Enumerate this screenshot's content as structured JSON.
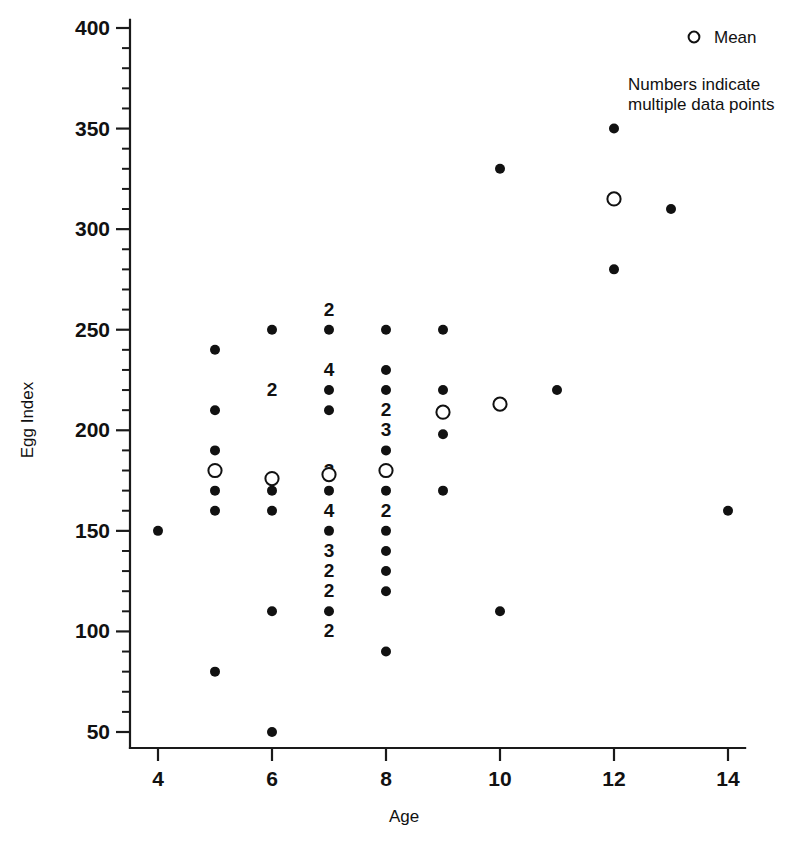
{
  "chart_data": {
    "type": "scatter",
    "title": "",
    "xlabel": "Age",
    "ylabel": "Egg Index",
    "xlim": [
      3.5,
      14.3
    ],
    "ylim": [
      42,
      404
    ],
    "grid": false,
    "x_ticks": [
      4,
      6,
      8,
      10,
      12,
      14
    ],
    "x_tick_labels": [
      "4",
      "6",
      "8",
      "10",
      "12",
      "14"
    ],
    "x_minor_step": 1,
    "y_ticks": [
      50,
      100,
      150,
      200,
      250,
      300,
      350,
      400
    ],
    "y_tick_labels": [
      "50",
      "100",
      "150",
      "200",
      "250",
      "300",
      "350",
      "400"
    ],
    "y_minor_step": 10,
    "legend": {
      "position": "top-right",
      "mean_marker_label": "Mean",
      "note_line_1": "Numbers indicate",
      "note_line_2": "multiple data points"
    },
    "series": [
      {
        "name": "Individual data points",
        "marker": "filled-circle",
        "points": [
          {
            "x": 4,
            "y": 150,
            "count": 1
          },
          {
            "x": 5,
            "y": 240,
            "count": 1
          },
          {
            "x": 5,
            "y": 210,
            "count": 1
          },
          {
            "x": 5,
            "y": 190,
            "count": 1
          },
          {
            "x": 5,
            "y": 170,
            "count": 1
          },
          {
            "x": 5,
            "y": 160,
            "count": 1
          },
          {
            "x": 5,
            "y": 80,
            "count": 1
          },
          {
            "x": 6,
            "y": 250,
            "count": 1
          },
          {
            "x": 6,
            "y": 220,
            "count": 2
          },
          {
            "x": 6,
            "y": 170,
            "count": 1
          },
          {
            "x": 6,
            "y": 160,
            "count": 1
          },
          {
            "x": 6,
            "y": 110,
            "count": 1
          },
          {
            "x": 6,
            "y": 50,
            "count": 1
          },
          {
            "x": 7,
            "y": 260,
            "count": 2
          },
          {
            "x": 7,
            "y": 250,
            "count": 1
          },
          {
            "x": 7,
            "y": 230,
            "count": 4
          },
          {
            "x": 7,
            "y": 220,
            "count": 1
          },
          {
            "x": 7,
            "y": 210,
            "count": 1
          },
          {
            "x": 7,
            "y": 180,
            "count": 3
          },
          {
            "x": 7,
            "y": 170,
            "count": 1
          },
          {
            "x": 7,
            "y": 160,
            "count": 4
          },
          {
            "x": 7,
            "y": 150,
            "count": 1
          },
          {
            "x": 7,
            "y": 140,
            "count": 3
          },
          {
            "x": 7,
            "y": 130,
            "count": 2
          },
          {
            "x": 7,
            "y": 120,
            "count": 2
          },
          {
            "x": 7,
            "y": 110,
            "count": 1
          },
          {
            "x": 7,
            "y": 100,
            "count": 2
          },
          {
            "x": 8,
            "y": 250,
            "count": 1
          },
          {
            "x": 8,
            "y": 230,
            "count": 1
          },
          {
            "x": 8,
            "y": 220,
            "count": 1
          },
          {
            "x": 8,
            "y": 210,
            "count": 2
          },
          {
            "x": 8,
            "y": 200,
            "count": 3
          },
          {
            "x": 8,
            "y": 190,
            "count": 1
          },
          {
            "x": 8,
            "y": 180,
            "count": 1
          },
          {
            "x": 8,
            "y": 170,
            "count": 1
          },
          {
            "x": 8,
            "y": 160,
            "count": 2
          },
          {
            "x": 8,
            "y": 150,
            "count": 1
          },
          {
            "x": 8,
            "y": 140,
            "count": 1
          },
          {
            "x": 8,
            "y": 130,
            "count": 1
          },
          {
            "x": 8,
            "y": 120,
            "count": 1
          },
          {
            "x": 8,
            "y": 90,
            "count": 1
          },
          {
            "x": 9,
            "y": 250,
            "count": 1
          },
          {
            "x": 9,
            "y": 220,
            "count": 1
          },
          {
            "x": 9,
            "y": 198,
            "count": 1
          },
          {
            "x": 9,
            "y": 170,
            "count": 1
          },
          {
            "x": 10,
            "y": 330,
            "count": 1
          },
          {
            "x": 10,
            "y": 110,
            "count": 1
          },
          {
            "x": 11,
            "y": 220,
            "count": 1
          },
          {
            "x": 12,
            "y": 350,
            "count": 1
          },
          {
            "x": 12,
            "y": 280,
            "count": 1
          },
          {
            "x": 13,
            "y": 310,
            "count": 1
          },
          {
            "x": 14,
            "y": 160,
            "count": 1
          }
        ]
      },
      {
        "name": "Mean",
        "marker": "open-circle",
        "points": [
          {
            "x": 5,
            "y": 180
          },
          {
            "x": 6,
            "y": 176
          },
          {
            "x": 7,
            "y": 178
          },
          {
            "x": 8,
            "y": 180
          },
          {
            "x": 9,
            "y": 209
          },
          {
            "x": 10,
            "y": 213
          },
          {
            "x": 12,
            "y": 315
          }
        ]
      }
    ]
  },
  "colors": {
    "ink": "#111111",
    "background": "#ffffff",
    "axis": "#1a1a1a"
  }
}
